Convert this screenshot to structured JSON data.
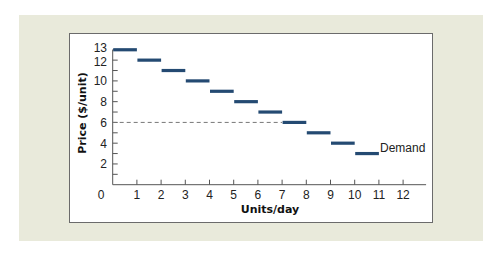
{
  "chart_data": {
    "type": "line",
    "subtype": "step",
    "title": "",
    "xlabel": "Units/day",
    "ylabel": "Price ($/unit)",
    "xlim": [
      0,
      12
    ],
    "ylim": [
      0,
      13
    ],
    "x_ticks": [
      0,
      1,
      2,
      3,
      4,
      5,
      6,
      7,
      8,
      9,
      10,
      11,
      12
    ],
    "x_tick_labels": [
      "0",
      "1",
      "2",
      "3",
      "4",
      "5",
      "6",
      "7",
      "8",
      "9",
      "10",
      "11",
      "12"
    ],
    "y_ticks": [
      1,
      2,
      3,
      4,
      5,
      6,
      7,
      8,
      9,
      10,
      11,
      12,
      13
    ],
    "y_tick_labels": [
      "2",
      "4",
      "6",
      "8",
      "10",
      "12",
      "13"
    ],
    "y_labeled_ticks": [
      2,
      4,
      6,
      8,
      10,
      12,
      13
    ],
    "grid": false,
    "legend": "none",
    "series": [
      {
        "name": "Demand",
        "color": "#244a72",
        "steps": [
          {
            "x_start": 0,
            "x_end": 1,
            "price": 13
          },
          {
            "x_start": 1,
            "x_end": 2,
            "price": 12
          },
          {
            "x_start": 2,
            "x_end": 3,
            "price": 11
          },
          {
            "x_start": 3,
            "x_end": 4,
            "price": 10
          },
          {
            "x_start": 4,
            "x_end": 5,
            "price": 9
          },
          {
            "x_start": 5,
            "x_end": 6,
            "price": 8
          },
          {
            "x_start": 6,
            "x_end": 7,
            "price": 7
          },
          {
            "x_start": 7,
            "x_end": 8,
            "price": 6
          },
          {
            "x_start": 8,
            "x_end": 9,
            "price": 5
          },
          {
            "x_start": 9,
            "x_end": 10,
            "price": 4
          },
          {
            "x_start": 10,
            "x_end": 11,
            "price": 3
          }
        ]
      }
    ],
    "annotations": [
      {
        "type": "dashed-hline",
        "y": 6,
        "x_start": 0,
        "x_end": 7,
        "color": "#777777"
      },
      {
        "type": "text",
        "text": "Demand",
        "x": 11,
        "y": 3
      }
    ]
  },
  "labels": {
    "x_axis_title": "Units/day",
    "y_axis_title": "Price ($/unit)",
    "series_label": "Demand",
    "origin": "0"
  },
  "colors": {
    "panel": "#e9eadb",
    "plot_bg": "#ffffff",
    "series": "#244a72",
    "dashed": "#777777",
    "axis": "#555555"
  }
}
